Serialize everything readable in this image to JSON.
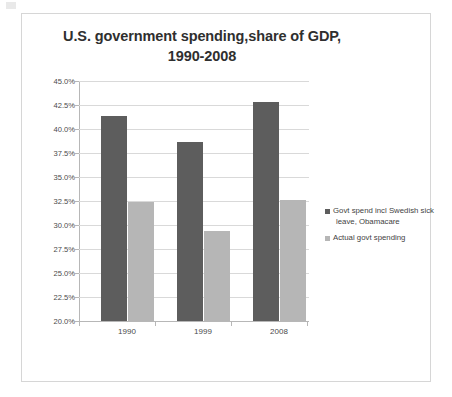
{
  "chart_data": {
    "type": "bar",
    "title": "U.S. government spending,share of GDP, 1990-2008",
    "title_line1": "U.S. government spending,share of GDP,",
    "title_line2": "1990-2008",
    "categories": [
      "1990",
      "1999",
      "2008"
    ],
    "series": [
      {
        "name": "Govt spend incl Swedish sick leave, Obamacare",
        "color": "#5d5d5d",
        "values": [
          41.4,
          38.6,
          42.8
        ]
      },
      {
        "name": "Actual govt spending",
        "color": "#b6b6b6",
        "values": [
          32.4,
          29.4,
          32.6
        ]
      }
    ],
    "xlabel": "",
    "ylabel": "",
    "ylim": [
      20.0,
      45.0
    ],
    "ytick_step": 2.5,
    "ytick_labels": [
      "45.0%",
      "42.5%",
      "40.0%",
      "37.5%",
      "35.0%",
      "32.5%",
      "30.0%",
      "27.5%",
      "25.0%",
      "22.5%",
      "20.0%"
    ],
    "ytick_values": [
      45.0,
      42.5,
      40.0,
      37.5,
      35.0,
      32.5,
      30.0,
      27.5,
      25.0,
      22.5,
      20.0
    ],
    "grid": true,
    "legend_position": "right",
    "legend_entries": [
      "Govt spend incl Swedish sick leave, Obamacare",
      "Actual govt spending"
    ],
    "legend_entry_lines": [
      [
        "Govt spend incl Swedish sick",
        "leave, Obamacare"
      ],
      [
        "Actual govt spending"
      ]
    ]
  }
}
